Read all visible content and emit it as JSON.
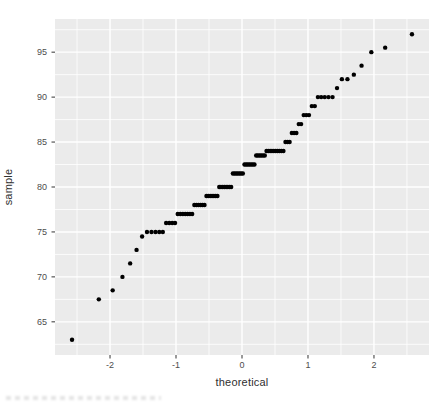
{
  "chart_data": {
    "type": "scatter",
    "title": "",
    "xlabel": "theoretical",
    "ylabel": "sample",
    "xlim": [
      -2.834,
      2.834
    ],
    "ylim": [
      61.31,
      98.69
    ],
    "x_ticks": [
      -2,
      -1,
      0,
      1,
      2
    ],
    "x_tick_labels": [
      "-2",
      "-1",
      "0",
      "1",
      "2"
    ],
    "y_ticks": [
      65,
      70,
      75,
      80,
      85,
      90,
      95
    ],
    "y_tick_labels": [
      "65",
      "70",
      "75",
      "80",
      "85",
      "90",
      "95"
    ],
    "x_minor": [
      -2.5,
      -1.5,
      -0.5,
      0.5,
      1.5,
      2.5
    ],
    "y_minor": [
      62.5,
      67.5,
      72.5,
      77.5,
      82.5,
      87.5,
      92.5,
      97.5
    ],
    "grid": true,
    "legend_position": "none",
    "theme": {
      "panel_bg": "#EBEBEB",
      "grid_color": "#FFFFFF",
      "point_color": "#000000",
      "tick_label_color": "#4D4D4D",
      "axis_title_color": "#303030",
      "tick_mark_color": "#333333",
      "outer_bg": "#FFFFFF"
    },
    "points": [
      [
        -2.576,
        63
      ],
      [
        -2.17,
        67.5
      ],
      [
        -1.96,
        68.5
      ],
      [
        -1.812,
        70
      ],
      [
        -1.695,
        71.5
      ],
      [
        -1.598,
        73
      ],
      [
        -1.514,
        74.5
      ],
      [
        -1.44,
        75
      ],
      [
        -1.372,
        75
      ],
      [
        -1.311,
        75
      ],
      [
        -1.254,
        75
      ],
      [
        -1.2,
        75
      ],
      [
        -1.15,
        76
      ],
      [
        -1.103,
        76
      ],
      [
        -1.058,
        76
      ],
      [
        -1.015,
        76
      ],
      [
        -0.974,
        77
      ],
      [
        -0.935,
        77
      ],
      [
        -0.896,
        77
      ],
      [
        -0.86,
        77
      ],
      [
        -0.824,
        77
      ],
      [
        -0.789,
        77
      ],
      [
        -0.755,
        77
      ],
      [
        -0.722,
        78
      ],
      [
        -0.69,
        78
      ],
      [
        -0.659,
        78
      ],
      [
        -0.628,
        78
      ],
      [
        -0.598,
        78
      ],
      [
        -0.568,
        78
      ],
      [
        -0.539,
        79
      ],
      [
        -0.51,
        79
      ],
      [
        -0.482,
        79
      ],
      [
        -0.454,
        79
      ],
      [
        -0.426,
        79
      ],
      [
        -0.399,
        79
      ],
      [
        -0.372,
        79
      ],
      [
        -0.345,
        80
      ],
      [
        -0.319,
        80
      ],
      [
        -0.292,
        80
      ],
      [
        -0.266,
        80
      ],
      [
        -0.24,
        80
      ],
      [
        -0.215,
        80
      ],
      [
        -0.189,
        80
      ],
      [
        -0.164,
        80
      ],
      [
        -0.138,
        81.5
      ],
      [
        -0.113,
        81.5
      ],
      [
        -0.088,
        81.5
      ],
      [
        -0.063,
        81.5
      ],
      [
        -0.038,
        81.5
      ],
      [
        -0.013,
        81.5
      ],
      [
        0.013,
        81.5
      ],
      [
        0.038,
        82.5
      ],
      [
        0.063,
        82.5
      ],
      [
        0.088,
        82.5
      ],
      [
        0.113,
        82.5
      ],
      [
        0.138,
        82.5
      ],
      [
        0.164,
        82.5
      ],
      [
        0.189,
        82.5
      ],
      [
        0.215,
        83.5
      ],
      [
        0.24,
        83.5
      ],
      [
        0.266,
        83.5
      ],
      [
        0.292,
        83.5
      ],
      [
        0.319,
        83.5
      ],
      [
        0.345,
        83.5
      ],
      [
        0.372,
        84
      ],
      [
        0.399,
        84
      ],
      [
        0.426,
        84
      ],
      [
        0.454,
        84
      ],
      [
        0.482,
        84
      ],
      [
        0.51,
        84
      ],
      [
        0.539,
        84
      ],
      [
        0.568,
        84
      ],
      [
        0.598,
        84
      ],
      [
        0.628,
        84
      ],
      [
        0.659,
        85
      ],
      [
        0.69,
        85
      ],
      [
        0.722,
        85
      ],
      [
        0.755,
        86
      ],
      [
        0.789,
        86
      ],
      [
        0.824,
        86
      ],
      [
        0.86,
        87
      ],
      [
        0.896,
        87
      ],
      [
        0.935,
        88
      ],
      [
        0.974,
        88
      ],
      [
        1.015,
        88
      ],
      [
        1.058,
        89
      ],
      [
        1.103,
        89
      ],
      [
        1.15,
        90
      ],
      [
        1.2,
        90
      ],
      [
        1.254,
        90
      ],
      [
        1.311,
        90
      ],
      [
        1.372,
        90
      ],
      [
        1.44,
        91
      ],
      [
        1.514,
        92
      ],
      [
        1.598,
        92
      ],
      [
        1.695,
        92.5
      ],
      [
        1.812,
        93.5
      ],
      [
        1.96,
        95
      ],
      [
        2.17,
        95.5
      ],
      [
        2.576,
        97
      ]
    ]
  }
}
